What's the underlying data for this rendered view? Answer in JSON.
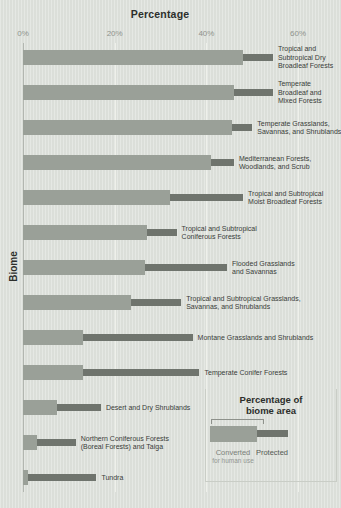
{
  "title": "Percentage",
  "y_axis_label": "Biome",
  "colors": {
    "background": "#dee2dc",
    "converted": "#9aa098",
    "protected": "#6f746d",
    "gridline": "#eef0ea",
    "axis_line": "#b2b6b0",
    "text_dark": "#2c2e2b",
    "text_tick": "#8f938d",
    "text_label": "#3a3d39",
    "legend_border": "#c9cdc6"
  },
  "legend": {
    "title_line1": "Percentage of",
    "title_line2": "biome area",
    "converted_label": "Converted",
    "converted_sublabel": "for human use",
    "protected_label": "Protected"
  },
  "chart_data": {
    "type": "bar",
    "orientation": "horizontal_stacked",
    "title": "Percentage",
    "xlabel": "Percentage",
    "ylabel": "Biome",
    "x_range": [
      0,
      66
    ],
    "grid": "vertical ticks at 20/40/60, light",
    "legend_position": "bottom-right box",
    "x_ticks": [
      {
        "value": 0,
        "label": "0%"
      },
      {
        "value": 20,
        "label": "20%"
      },
      {
        "value": 40,
        "label": "40%"
      },
      {
        "value": 60,
        "label": "60%"
      }
    ],
    "categories": [
      "Tropical and Subtropical Dry Broadleaf Forests",
      "Temperate Broadleaf and Mixed Forests",
      "Temperate Grasslands, Savannas, and Shrublands",
      "Mediterranean Forests, Woodlands, and Scrub",
      "Tropical and Subtropical Moist Broadleaf Forests",
      "Tropical and Subtropical Coniferous Forests",
      "Flooded Grasslands and Savannas",
      "Tropical and Subtropical Grasslands, Savannas, and Shrublands",
      "Montane Grasslands and Shrublands",
      "Temperate Conifer Forests",
      "Desert and Dry Shrublands",
      "Northern Coniferous Forests (Boreal Forests) and Taiga",
      "Tundra"
    ],
    "category_label_lines": [
      [
        "Tropical and",
        "Subtropical Dry",
        "Broadleaf Forests"
      ],
      [
        "Temperate",
        "Broadleaf and",
        "Mixed Forests"
      ],
      [
        "Temperate Grasslands,",
        "Savannas, and Shrublands"
      ],
      [
        "Mediterranean Forests,",
        "Woodlands, and Scrub"
      ],
      [
        "Tropical and Subtropical",
        "Moist Broadleaf Forests"
      ],
      [
        "Tropical and Subtropical",
        "Coniferous Forests"
      ],
      [
        "Flooded Grasslands",
        "and Savannas"
      ],
      [
        "Tropical and Subtropical Grasslands,",
        "Savannas, and Shrublands"
      ],
      [
        "Montane Grasslands and Shrublands"
      ],
      [
        "Temperate Conifer Forests"
      ],
      [
        "Desert and Dry Shrublands"
      ],
      [
        "Northern Coniferous Forests",
        "(Boreal Forests) and Taiga"
      ],
      [
        "Tundra"
      ]
    ],
    "series": [
      {
        "name": "Converted for human use",
        "values": [
          48,
          46,
          45.5,
          41,
          32,
          27,
          26.5,
          23.5,
          13,
          13,
          7.5,
          3,
          1
        ]
      },
      {
        "name": "Protected",
        "values": [
          6.5,
          8.5,
          4.5,
          5,
          16,
          6.5,
          18,
          11,
          24,
          25.5,
          9.5,
          8.5,
          15
        ]
      }
    ]
  }
}
